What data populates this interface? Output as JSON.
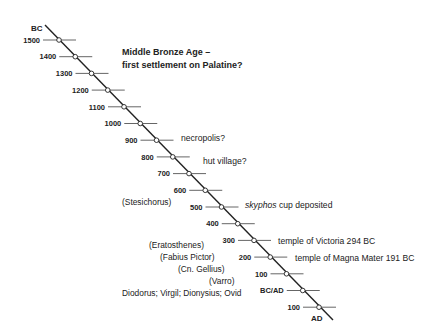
{
  "timeline": {
    "start_label": "BC",
    "end_label": "AD",
    "ticks": [
      {
        "label": "1500"
      },
      {
        "label": "1400"
      },
      {
        "label": "1300"
      },
      {
        "label": "1200"
      },
      {
        "label": "1100"
      },
      {
        "label": "1000"
      },
      {
        "label": "900"
      },
      {
        "label": "800"
      },
      {
        "label": "700"
      },
      {
        "label": "600"
      },
      {
        "label": "500"
      },
      {
        "label": "400"
      },
      {
        "label": "300"
      },
      {
        "label": "200"
      },
      {
        "label": "100"
      },
      {
        "label": "BC/AD"
      },
      {
        "label": "100"
      }
    ],
    "line_color": "#222222"
  },
  "events": {
    "bronze_age_line1": "Middle Bronze Age –",
    "bronze_age_line2": "first settlement on Palatine?",
    "necropolis": "necropolis?",
    "hut_village": "hut village?",
    "skyphos_italic": "skyphos",
    "skyphos_rest": " cup deposited",
    "victoria": "temple of Victoria 294 BC",
    "magna_mater": "temple of Magna Mater 191 BC"
  },
  "sources": {
    "stesichorus": "(Stesichorus)",
    "eratosthenes": "(Eratosthenes)",
    "fabius_pictor": "(Fabius Pictor)",
    "cn_gellius": "(Cn. Gellius)",
    "varro": "(Varro)",
    "later_authors": "Diodorus; Virgil; Dionysius; Ovid"
  }
}
